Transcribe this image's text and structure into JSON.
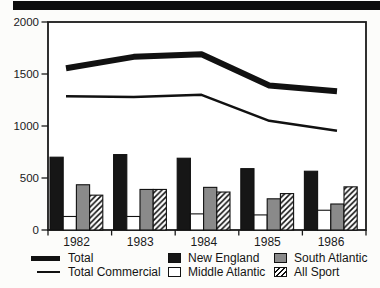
{
  "banner": {
    "color": "#0d0d0d"
  },
  "chart_data": {
    "type": "line+bar",
    "title": "",
    "xlabel": "",
    "ylabel": "",
    "categories": [
      "1982",
      "1983",
      "1984",
      "1985",
      "1986"
    ],
    "ylim": [
      0,
      2000
    ],
    "yticks": [
      0,
      500,
      1000,
      1500,
      2000
    ],
    "grid": false,
    "legend_position": "bottom",
    "line_series": [
      {
        "name": "Total",
        "style": "thick",
        "values": [
          1555,
          1665,
          1690,
          1390,
          1335
        ]
      },
      {
        "name": "Total Commercial",
        "style": "thin",
        "values": [
          1285,
          1280,
          1300,
          1050,
          955
        ]
      }
    ],
    "bar_series": [
      {
        "name": "New England",
        "fill": "black",
        "values": [
          700,
          725,
          690,
          590,
          565
        ]
      },
      {
        "name": "Middle Atlantic",
        "fill": "white",
        "values": [
          130,
          130,
          155,
          145,
          190
        ]
      },
      {
        "name": "South Atlantic",
        "fill": "gray",
        "values": [
          435,
          390,
          410,
          300,
          250
        ]
      },
      {
        "name": "All Sport",
        "fill": "hatch",
        "values": [
          335,
          390,
          365,
          350,
          415
        ]
      }
    ],
    "colors": {
      "black": "#161616",
      "gray": "#8a8a8a",
      "white": "#ffffff",
      "hatch_stroke": "#111111",
      "axis": "#1a1a1a"
    }
  },
  "legend": {
    "lines": [
      {
        "label": "Total",
        "swatch": "thick-line"
      },
      {
        "label": "Total Commercial",
        "swatch": "thin-line"
      }
    ],
    "bars": [
      {
        "label": "New England",
        "swatch": "black-square"
      },
      {
        "label": "Middle Atlantic",
        "swatch": "white-square"
      },
      {
        "label": "South Atlantic",
        "swatch": "gray-square"
      },
      {
        "label": "All Sport",
        "swatch": "hatch-square"
      }
    ]
  }
}
